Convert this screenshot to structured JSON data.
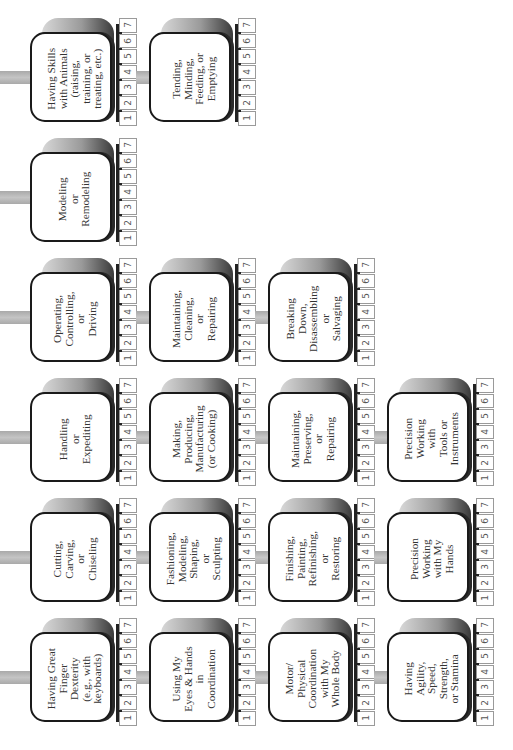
{
  "diagram": {
    "orientation": "rotated-90-ccw",
    "scale": [
      "1",
      "2",
      "3",
      "4",
      "5",
      "6",
      "7"
    ],
    "colors": {
      "box_border": "#1a1a1a",
      "connector": "#b5b5b5",
      "number_border": "#9a9a9a",
      "text": "#333333"
    },
    "rows": [
      {
        "cards": [
          {
            "label": "Having Skills\nwith Animals\n(raising,\ntraining, or\ntreating, etc.)"
          },
          {
            "label": "Tending,\nMinding,\nFeeding, or\nEmptying"
          }
        ]
      },
      {
        "cards": [
          {
            "label": "Modeling\nor\nRemodeling"
          }
        ]
      },
      {
        "cards": [
          {
            "label": "Operating,\nControlling,\nor\nDriving"
          },
          {
            "label": "Maintaining,\nCleaning,\nor\nRepairing"
          },
          {
            "label": "Breaking\nDown,\nDisassembling\nor\nSalvaging"
          }
        ]
      },
      {
        "cards": [
          {
            "label": "Handling\nor\nExpediting"
          },
          {
            "label": "Making,\nProducing,\nManufacturing\n(or Cooking)"
          },
          {
            "label": "Maintaining,\nPreserving,\nor\nRepairing"
          },
          {
            "label": "Precision\nWorking\nwith\nTools or\nInstruments"
          }
        ]
      },
      {
        "cards": [
          {
            "label": "Cutting,\nCarving,\nor\nChiseling"
          },
          {
            "label": "Fashioning,\nModeling,\nShaping,\nor\nSculpting"
          },
          {
            "label": "Finishing,\nPainting,\nRefinishing,\nor\nRestoring"
          },
          {
            "label": "Precision\nWorking\nwith My\nHands"
          }
        ]
      },
      {
        "cards": [
          {
            "label": "Having Great\nFinger\nDexterity\n(e.g., with\nkeyboards)"
          },
          {
            "label": "Using My\nEyes & Hands\nin\nCoordination"
          },
          {
            "label": "Motor/\nPhysical\nCoordination\nwith My\nWhole Body"
          },
          {
            "label": "Having\nAgility,\nSpeed,\nStrength,\nor Stamina"
          }
        ]
      }
    ]
  }
}
